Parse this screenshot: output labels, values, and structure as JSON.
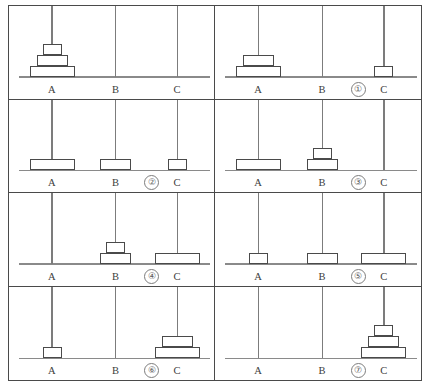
{
  "figure": {
    "peg_labels": [
      "A",
      "B",
      "C"
    ],
    "disk_sizes": [
      "large",
      "medium",
      "small"
    ],
    "panel_count": 8,
    "grid": {
      "columns": 2,
      "rows": 4
    }
  },
  "panels": [
    {
      "id": "panel-0",
      "step_label": "",
      "has_step_label": false,
      "pegs": [
        {
          "name": "A",
          "disks": [
            3,
            2,
            1
          ]
        },
        {
          "name": "B",
          "disks": []
        },
        {
          "name": "C",
          "disks": []
        }
      ]
    },
    {
      "id": "panel-1",
      "step_label": "①",
      "has_step_label": true,
      "pegs": [
        {
          "name": "A",
          "disks": [
            3,
            2
          ]
        },
        {
          "name": "B",
          "disks": []
        },
        {
          "name": "C",
          "disks": [
            1
          ]
        }
      ]
    },
    {
      "id": "panel-2",
      "step_label": "②",
      "has_step_label": true,
      "pegs": [
        {
          "name": "A",
          "disks": [
            3
          ]
        },
        {
          "name": "B",
          "disks": [
            2
          ]
        },
        {
          "name": "C",
          "disks": [
            1
          ]
        }
      ]
    },
    {
      "id": "panel-3",
      "step_label": "③",
      "has_step_label": true,
      "pegs": [
        {
          "name": "A",
          "disks": [
            3
          ]
        },
        {
          "name": "B",
          "disks": [
            2,
            1
          ]
        },
        {
          "name": "C",
          "disks": []
        }
      ]
    },
    {
      "id": "panel-4",
      "step_label": "④",
      "has_step_label": true,
      "pegs": [
        {
          "name": "A",
          "disks": []
        },
        {
          "name": "B",
          "disks": [
            2,
            1
          ]
        },
        {
          "name": "C",
          "disks": [
            3
          ]
        }
      ]
    },
    {
      "id": "panel-5",
      "step_label": "⑤",
      "has_step_label": true,
      "pegs": [
        {
          "name": "A",
          "disks": [
            1
          ]
        },
        {
          "name": "B",
          "disks": [
            2
          ]
        },
        {
          "name": "C",
          "disks": [
            3
          ]
        }
      ]
    },
    {
      "id": "panel-6",
      "step_label": "⑥",
      "has_step_label": true,
      "pegs": [
        {
          "name": "A",
          "disks": [
            1
          ]
        },
        {
          "name": "B",
          "disks": []
        },
        {
          "name": "C",
          "disks": [
            3,
            2
          ]
        }
      ]
    },
    {
      "id": "panel-7",
      "step_label": "⑦",
      "has_step_label": true,
      "pegs": [
        {
          "name": "A",
          "disks": []
        },
        {
          "name": "B",
          "disks": []
        },
        {
          "name": "C",
          "disks": [
            3,
            2,
            1
          ]
        }
      ]
    }
  ],
  "layout": {
    "peg_x_percent": [
      21,
      52,
      82
    ],
    "badge_x_percent": 66
  }
}
